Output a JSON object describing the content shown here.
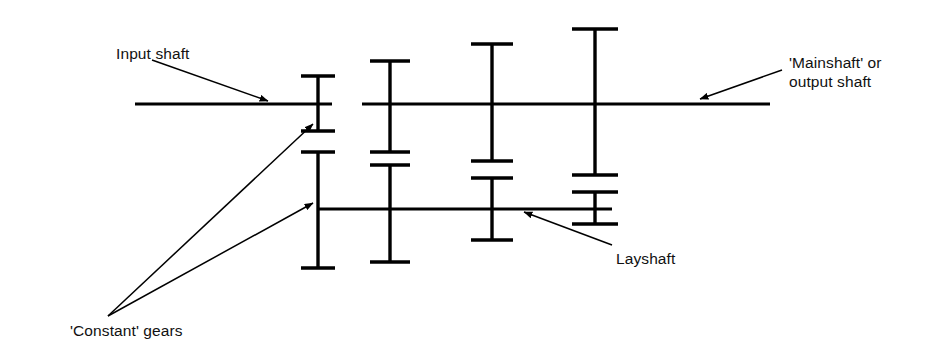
{
  "figure": {
    "kind": "gearbox-schematic",
    "background_color": "#ffffff",
    "line_color": "#000000",
    "text_color": "#111111",
    "width": 935,
    "height": 362
  },
  "labels": {
    "input_shaft": "Input shaft",
    "mainshaft_line1": "'Mainshaft' or",
    "mainshaft_line2": "output shaft",
    "constant_gears": "'Constant' gears",
    "layshaft": "Layshaft"
  },
  "geometry": {
    "mainshaft_y": 104,
    "layshaft_y": 209,
    "input_shaft_x": [
      135,
      332
    ],
    "mainshaft_x": [
      362,
      770
    ],
    "layshaft_x": [
      318,
      612
    ],
    "gear_columns_x": [
      318,
      390,
      492,
      595
    ]
  },
  "gears": {
    "upper": [
      {
        "column": 1,
        "x": 318,
        "top": 76,
        "bottom": 131,
        "top_cap_half": 17,
        "bottom_cap_half": 17
      },
      {
        "column": 2,
        "x": 390,
        "top": 61,
        "bottom": 152,
        "top_cap_half": 20,
        "bottom_cap_half": 20
      },
      {
        "column": 3,
        "x": 492,
        "top": 44,
        "bottom": 161,
        "top_cap_half": 21,
        "bottom_cap_half": 21
      },
      {
        "column": 4,
        "x": 595,
        "top": 29,
        "bottom": 175,
        "top_cap_half": 23,
        "bottom_cap_half": 23
      }
    ],
    "lower": [
      {
        "column": 1,
        "x": 318,
        "top": 152,
        "bottom": 268,
        "top_cap_half": 17,
        "bottom_cap_half": 17
      },
      {
        "column": 2,
        "x": 390,
        "top": 165,
        "bottom": 262,
        "top_cap_half": 20,
        "bottom_cap_half": 20
      },
      {
        "column": 3,
        "x": 492,
        "top": 178,
        "bottom": 240,
        "top_cap_half": 21,
        "bottom_cap_half": 21
      },
      {
        "column": 4,
        "x": 595,
        "top": 192,
        "bottom": 224,
        "top_cap_half": 23,
        "bottom_cap_half": 23
      }
    ]
  },
  "leaders": [
    {
      "name": "input-shaft-leader",
      "from": [
        152,
        60
      ],
      "to": [
        268,
        101
      ]
    },
    {
      "name": "mainshaft-leader",
      "from": [
        782,
        70
      ],
      "to": [
        700,
        99
      ]
    },
    {
      "name": "constant-gears-upper",
      "from": [
        108,
        316
      ],
      "to": [
        313,
        124
      ]
    },
    {
      "name": "constant-gears-lower",
      "from": [
        108,
        316
      ],
      "to": [
        313,
        203
      ]
    },
    {
      "name": "layshaft-leader",
      "from": [
        612,
        245
      ],
      "to": [
        524,
        212
      ]
    }
  ]
}
